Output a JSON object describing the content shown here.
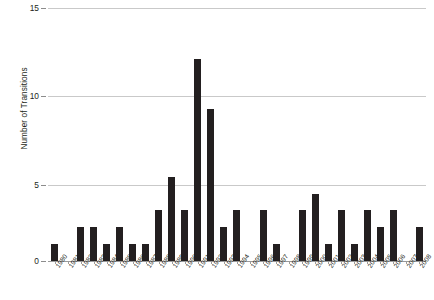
{
  "chart_data": {
    "type": "bar",
    "title": "",
    "xlabel": "",
    "ylabel": "Number of Transitions",
    "ylim": [
      0,
      15
    ],
    "yticks": [
      0,
      5,
      10,
      15
    ],
    "ytick_labels": [
      "0",
      "5",
      "10",
      "15"
    ],
    "grid": true,
    "legend": null,
    "bar_color": "#231f20",
    "categories": [
      "1980",
      "1981",
      "1982",
      "1983",
      "1984",
      "1985",
      "1986",
      "1987",
      "1988",
      "1989",
      "1990",
      "1991",
      "1992",
      "1993",
      "1994",
      "1995",
      "1996",
      "1997",
      "1998",
      "1999",
      "2000",
      "2001",
      "2002",
      "2003",
      "2004",
      "2005",
      "2006",
      "2007",
      "2008"
    ],
    "values": [
      1,
      0,
      2,
      2,
      1,
      2,
      1,
      1,
      3,
      5,
      3,
      12,
      9,
      2,
      3,
      0,
      3,
      1,
      0,
      3,
      4,
      1,
      3,
      1,
      3,
      2,
      3,
      0,
      2
    ]
  },
  "caption": {
    "text": ""
  },
  "colors": {
    "bar": "#231f20",
    "gridline": "#c9c9c9",
    "axis": "#9a9a9a",
    "text": "#231f20"
  }
}
